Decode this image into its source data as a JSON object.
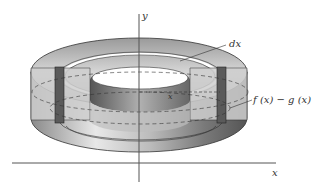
{
  "diagram": {
    "type": "solid-of-revolution-shell",
    "labels": {
      "y_axis": "y",
      "x_axis": "x",
      "dx": "dx",
      "radius": "x",
      "height": "f (x) − g (x)"
    },
    "colors": {
      "background": "#ffffff",
      "axis": "#555555",
      "solid_light": "#e6e6e6",
      "solid_mid": "#bdbdbd",
      "solid_dark": "#6e6e6e",
      "shell": "#5a5a5a",
      "cut_face": "#c8c8c8",
      "outline": "#333333"
    }
  }
}
